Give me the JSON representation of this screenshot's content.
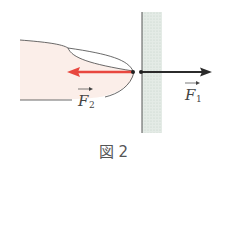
{
  "figure": {
    "caption": "図 2",
    "labels": {
      "f1": "F",
      "f1_sub": "1",
      "f2": "F",
      "f2_sub": "2"
    },
    "colors": {
      "f1_arrow": "#2b2b2b",
      "f2_arrow": "#e8473f",
      "finger_fill": "#fbeee9",
      "wall_fill": "#d9e3dc"
    }
  }
}
